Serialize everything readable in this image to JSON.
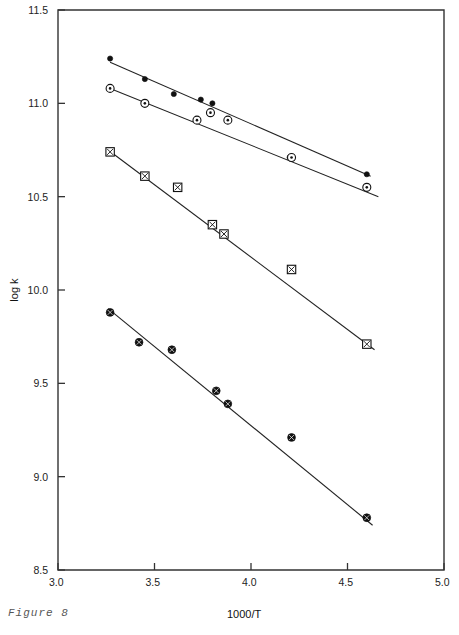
{
  "figure": {
    "caption": "Figure 8"
  },
  "chart_data": {
    "type": "scatter",
    "title": "",
    "subtitle": "",
    "xlabel": "1000/T",
    "ylabel": "log k",
    "xlim": [
      3.0,
      5.0
    ],
    "ylim": [
      8.5,
      11.5
    ],
    "xticks": [
      3.0,
      3.5,
      4.0,
      4.5,
      5.0
    ],
    "xticklabels": [
      "3.0",
      "3.5",
      "4.0",
      "4.5",
      "5.0"
    ],
    "yticks": [
      8.5,
      9.0,
      9.5,
      10.0,
      10.5,
      11.0,
      11.5
    ],
    "yticklabels": [
      "8.5",
      "9.0",
      "9.5",
      "10.0",
      "10.5",
      "11.0",
      "11.5"
    ],
    "grid": false,
    "legend": "none",
    "frame": "box",
    "series": [
      {
        "name": "series-1",
        "marker": "filled-circle",
        "fit": true,
        "x": [
          3.27,
          3.45,
          3.6,
          3.74,
          3.8,
          4.2,
          4.6
        ],
        "y": [
          11.24,
          11.13,
          11.05,
          11.02,
          11.0,
          10.71,
          10.62
        ],
        "fit_endpoints": {
          "x": [
            3.27,
            4.62
          ],
          "y": [
            11.22,
            10.61
          ]
        }
      },
      {
        "name": "series-2",
        "marker": "open-circle-dot",
        "fit": true,
        "x": [
          3.27,
          3.45,
          3.72,
          3.79,
          3.88,
          4.21,
          4.6
        ],
        "y": [
          11.08,
          11.0,
          10.91,
          10.95,
          10.91,
          10.71,
          10.55
        ],
        "fit_endpoints": {
          "x": [
            3.27,
            4.66
          ],
          "y": [
            11.08,
            10.5
          ]
        }
      },
      {
        "name": "series-3",
        "marker": "square-crossed",
        "fit": true,
        "x": [
          3.27,
          3.45,
          3.62,
          3.8,
          3.86,
          4.21,
          4.6
        ],
        "y": [
          10.74,
          10.61,
          10.55,
          10.35,
          10.3,
          10.11,
          9.71
        ],
        "fit_endpoints": {
          "x": [
            3.26,
            4.64
          ],
          "y": [
            10.75,
            9.68
          ]
        }
      },
      {
        "name": "series-4",
        "marker": "filled-circle-crossed",
        "fit": true,
        "x": [
          3.27,
          3.42,
          3.59,
          3.82,
          3.88,
          4.21,
          4.6
        ],
        "y": [
          9.88,
          9.72,
          9.68,
          9.46,
          9.39,
          9.21,
          8.78
        ],
        "fit_endpoints": {
          "x": [
            3.26,
            4.63
          ],
          "y": [
            9.9,
            8.74
          ]
        }
      }
    ]
  }
}
